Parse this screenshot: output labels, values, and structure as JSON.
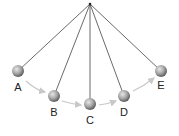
{
  "diagram": {
    "type": "pendulum-swing",
    "pivot": {
      "x": 90,
      "y": 4
    },
    "colors": {
      "string": "#444444",
      "ball_light": "#d8d8d8",
      "ball_dark": "#6a6a6a",
      "arrow": "#c8c8c8",
      "label": "#222222"
    },
    "positions": [
      {
        "label": "A",
        "x": 18,
        "y": 71,
        "label_y": 91
      },
      {
        "label": "B",
        "x": 54,
        "y": 96,
        "label_y": 116
      },
      {
        "label": "C",
        "x": 90,
        "y": 104,
        "label_y": 124
      },
      {
        "label": "D",
        "x": 124,
        "y": 96,
        "label_y": 116
      },
      {
        "label": "E",
        "x": 161,
        "y": 71,
        "label_y": 89
      }
    ]
  }
}
